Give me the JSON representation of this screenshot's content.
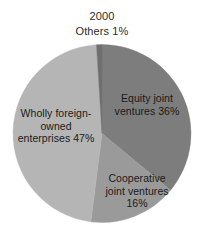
{
  "title": {
    "year": "2000",
    "others_note": "Others 1%"
  },
  "chart_data": {
    "type": "pie",
    "title": "2000",
    "xlabel": "",
    "ylabel": "",
    "legend_position": "none",
    "grid": false,
    "labels_inside_slices": true,
    "categories": [
      "Equity joint ventures",
      "Cooperative joint ventures",
      "Wholly foreign-owned enterprises",
      "Others"
    ],
    "values": [
      36,
      16,
      47,
      1
    ],
    "unit": "%",
    "slices": [
      {
        "name": "Equity joint ventures",
        "value": 36,
        "label": "Equity joint\nventures 36%",
        "color": "#7d7d7d",
        "start_angle_deg": 0,
        "end_angle_deg": 129.6
      },
      {
        "name": "Cooperative joint ventures",
        "value": 16,
        "label": "Cooperative\njoint ventures\n16%",
        "color": "#9a9a9a",
        "start_angle_deg": 129.6,
        "end_angle_deg": 187.2
      },
      {
        "name": "Wholly foreign-owned enterprises",
        "value": 47,
        "label": "Wholly foreign-\nowned\nenterprises 47%",
        "color": "#b5b5b5",
        "start_angle_deg": 187.2,
        "end_angle_deg": 356.4
      },
      {
        "name": "Others",
        "value": 1,
        "label": "Others 1%",
        "color": "#6f6f6f",
        "start_angle_deg": 356.4,
        "end_angle_deg": 360
      }
    ]
  },
  "geometry": {
    "center_x": 102,
    "center_y": 133.5,
    "radius": 89
  },
  "colors": {
    "background": "#ffffff",
    "text": "#1a1a1a",
    "slice_equity": "#7d7d7d",
    "slice_cooperative": "#9a9a9a",
    "slice_wholly": "#b5b5b5",
    "slice_others": "#6f6f6f"
  }
}
